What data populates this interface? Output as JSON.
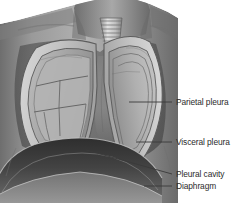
{
  "figure": {
    "style": "grayscale anatomical illustration",
    "background_color": "#ffffff"
  },
  "labels": [
    {
      "id": "parietal-pleura",
      "text": "Parietal pleura",
      "text_x": 176,
      "text_y": 106,
      "leader": {
        "x1": 129,
        "y1": 102,
        "x2": 172,
        "y2": 102
      }
    },
    {
      "id": "visceral-pleura",
      "text": "Visceral pleura",
      "text_x": 176,
      "text_y": 146,
      "leader": {
        "x1": 136,
        "y1": 142,
        "x2": 172,
        "y2": 142
      }
    },
    {
      "id": "pleural-cavity",
      "text": "Pleural cavity",
      "text_x": 176,
      "text_y": 178,
      "leader": {
        "x1": 86,
        "y1": 150,
        "x2": 172,
        "y2": 174
      }
    },
    {
      "id": "diaphragm",
      "text": "Diaphragm",
      "text_x": 176,
      "text_y": 190,
      "leader": {
        "x1": 144,
        "y1": 186,
        "x2": 172,
        "y2": 186
      }
    }
  ],
  "anatomy": {
    "structures": [
      {
        "name": "trachea",
        "description": "banded cartilage tube in midline neck"
      },
      {
        "name": "left-lung",
        "description": "viewer-left lung with lobar fissures"
      },
      {
        "name": "right-lung",
        "description": "viewer-right lung with concentric pleural outlines"
      },
      {
        "name": "mediastinum",
        "description": "central light vertical band between lungs"
      },
      {
        "name": "diaphragm",
        "description": "dark dome at base of thoracic cavity"
      },
      {
        "name": "chest-wall",
        "description": "outer torso, shoulders and neck"
      },
      {
        "name": "pleural-cavity",
        "description": "thin space between pleural layers"
      }
    ]
  },
  "palette": {
    "text": "#2b2b2b",
    "leader_line": "#3a3a3a",
    "torso_mid": "#8c8c8c",
    "torso_dark": "#5a5a5a",
    "lung_light": "#c9c9c9",
    "lung_mid": "#a6a6a6",
    "diaphragm_dark": "#3c3c3c",
    "cavity_dark": "#4a4a4a",
    "outline": "#565656"
  }
}
